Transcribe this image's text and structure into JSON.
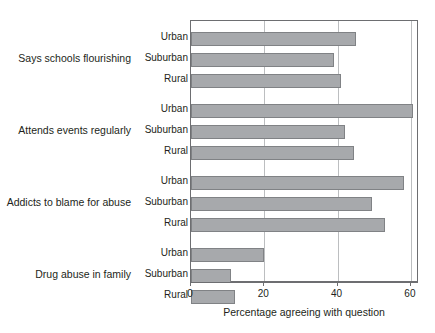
{
  "chart_data": {
    "type": "bar",
    "orientation": "horizontal",
    "title": "",
    "xlabel": "Percentage agreeing with question",
    "ylabel": "",
    "xlim": [
      0,
      62
    ],
    "xticks": [
      0,
      20,
      40,
      60
    ],
    "xtick_labels": [
      "0",
      "20",
      "40",
      "60"
    ],
    "grid": "vertical",
    "legend": "none",
    "categories": [
      "Urban",
      "Suburban",
      "Rural"
    ],
    "groups": [
      {
        "label": "Says schools flourishing",
        "bars": [
          {
            "category": "Urban",
            "value": 45
          },
          {
            "category": "Suburban",
            "value": 39
          },
          {
            "category": "Rural",
            "value": 41
          }
        ]
      },
      {
        "label": "Attends events regularly",
        "bars": [
          {
            "category": "Urban",
            "value": 60.5
          },
          {
            "category": "Suburban",
            "value": 42
          },
          {
            "category": "Rural",
            "value": 44.5
          }
        ]
      },
      {
        "label": "Addicts to blame for abuse",
        "bars": [
          {
            "category": "Urban",
            "value": 58
          },
          {
            "category": "Suburban",
            "value": 49.5
          },
          {
            "category": "Rural",
            "value": 53
          }
        ]
      },
      {
        "label": "Drug abuse in family",
        "bars": [
          {
            "category": "Urban",
            "value": 20
          },
          {
            "category": "Suburban",
            "value": 11
          },
          {
            "category": "Rural",
            "value": 12
          }
        ]
      }
    ],
    "colors": {
      "bar_fill": "#a7a9ac",
      "bar_stroke": "#808285",
      "gridline": "#bcbec0",
      "axis": "#6d6e71",
      "text": "#231f20",
      "background": "#ffffff"
    }
  }
}
